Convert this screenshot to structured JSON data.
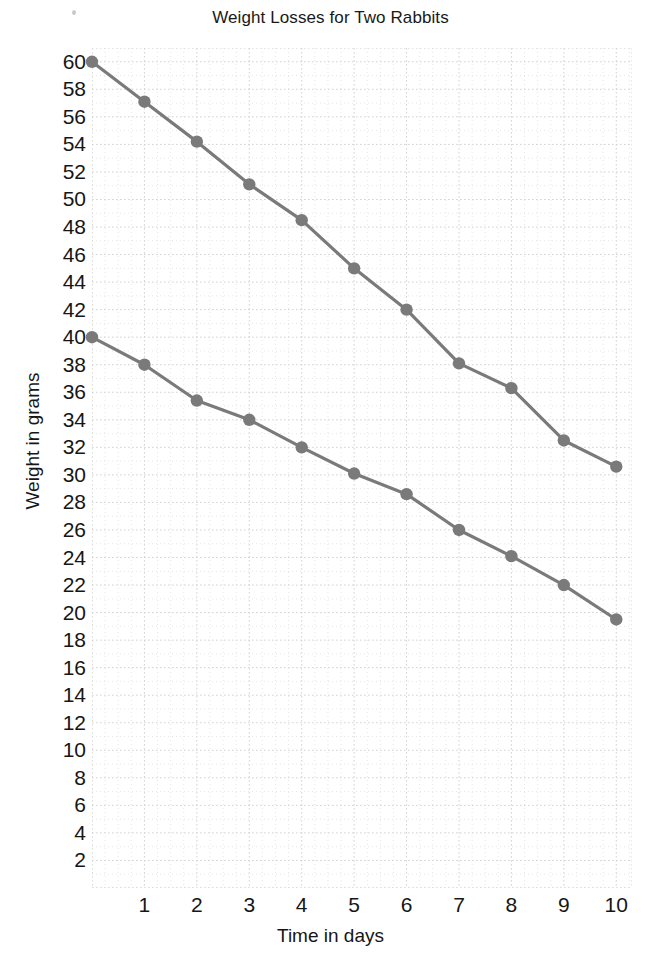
{
  "chart_data": {
    "type": "line",
    "title": "Weight Losses for Two Rabbits",
    "xlabel": "Time in days",
    "ylabel": "Weight in grams",
    "x": [
      0,
      1,
      2,
      3,
      4,
      5,
      6,
      7,
      8,
      9,
      10
    ],
    "xlim": [
      0,
      10.3
    ],
    "ylim": [
      0,
      61
    ],
    "xticks": [
      "1",
      "2",
      "3",
      "4",
      "5",
      "6",
      "7",
      "8",
      "9",
      "10"
    ],
    "xtick_values": [
      1,
      2,
      3,
      4,
      5,
      6,
      7,
      8,
      9,
      10
    ],
    "yticks": [
      "2",
      "4",
      "6",
      "8",
      "10",
      "12",
      "14",
      "16",
      "18",
      "20",
      "22",
      "24",
      "26",
      "28",
      "30",
      "32",
      "34",
      "36",
      "38",
      "40",
      "42",
      "44",
      "46",
      "48",
      "50",
      "52",
      "54",
      "56",
      "58",
      "60"
    ],
    "ytick_values": [
      2,
      4,
      6,
      8,
      10,
      12,
      14,
      16,
      18,
      20,
      22,
      24,
      26,
      28,
      30,
      32,
      34,
      36,
      38,
      40,
      42,
      44,
      46,
      48,
      50,
      52,
      54,
      56,
      58,
      60
    ],
    "grid": true,
    "grid_style": "dotted",
    "grid_color": "#d8d8d8",
    "legend": "none",
    "line_color": "#7a7a7a",
    "marker_color": "#7a7a7a",
    "marker": "circle",
    "series": [
      {
        "name": "Rabbit 1",
        "values": [
          60,
          57.1,
          54.2,
          51.1,
          48.5,
          45.0,
          42.0,
          38.1,
          36.3,
          32.5,
          30.6
        ]
      },
      {
        "name": "Rabbit 2",
        "values": [
          40,
          38.0,
          35.4,
          34.0,
          32.0,
          30.1,
          28.6,
          26.0,
          24.1,
          22.0,
          19.5
        ]
      }
    ]
  }
}
